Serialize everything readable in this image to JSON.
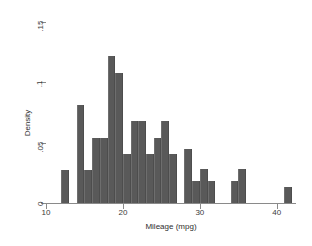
{
  "chart_data": {
    "type": "bar",
    "title": "",
    "xlabel": "Mileage (mpg)",
    "ylabel": "Density",
    "xlim": [
      10.0,
      42.5
    ],
    "ylim": [
      0,
      0.15
    ],
    "grid": false,
    "legend": null,
    "bin_width": 1,
    "xticks": [
      10,
      20,
      30,
      40
    ],
    "xtick_labels": [
      "10",
      "20",
      "30",
      "40"
    ],
    "yticks": [
      0,
      0.05,
      0.1,
      0.15
    ],
    "ytick_labels": [
      "0",
      ".05",
      ".1",
      ".15"
    ],
    "bar_color": "#595959",
    "axis_color": "#8a8a8a",
    "categories": [
      12,
      14,
      15,
      16,
      17,
      18,
      19,
      20,
      21,
      22,
      23,
      24,
      25,
      26,
      28,
      29,
      30,
      31,
      34,
      35,
      41
    ],
    "values": [
      0.027,
      0.081,
      0.027,
      0.054,
      0.054,
      0.122,
      0.108,
      0.041,
      0.068,
      0.068,
      0.041,
      0.054,
      0.068,
      0.041,
      0.045,
      0.018,
      0.028,
      0.018,
      0.018,
      0.028,
      0.0135
    ],
    "bars": [
      {
        "x": 12,
        "density": 0.027
      },
      {
        "x": 14,
        "density": 0.081
      },
      {
        "x": 15,
        "density": 0.027
      },
      {
        "x": 16,
        "density": 0.054
      },
      {
        "x": 17,
        "density": 0.054
      },
      {
        "x": 18,
        "density": 0.122
      },
      {
        "x": 19,
        "density": 0.108
      },
      {
        "x": 20,
        "density": 0.041
      },
      {
        "x": 21,
        "density": 0.068
      },
      {
        "x": 22,
        "density": 0.068
      },
      {
        "x": 23,
        "density": 0.041
      },
      {
        "x": 24,
        "density": 0.054
      },
      {
        "x": 25,
        "density": 0.068
      },
      {
        "x": 26,
        "density": 0.041
      },
      {
        "x": 28,
        "density": 0.045
      },
      {
        "x": 29,
        "density": 0.018
      },
      {
        "x": 30,
        "density": 0.028
      },
      {
        "x": 31,
        "density": 0.018
      },
      {
        "x": 34,
        "density": 0.018
      },
      {
        "x": 35,
        "density": 0.028
      },
      {
        "x": 41,
        "density": 0.0135
      }
    ]
  }
}
